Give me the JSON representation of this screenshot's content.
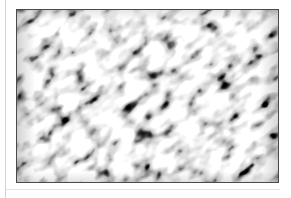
{
  "page": {
    "background_color": "#ffffff",
    "width": 291,
    "height": 198,
    "left_rule_color": "#d4d4d4",
    "bottom_rule_color": "#e3e3e3"
  },
  "figure": {
    "name": "grayscale-noise-texture",
    "border_color": "#4a4a4a",
    "base_color": "#9a9a9a",
    "x": 16,
    "y": 9,
    "width": 263,
    "height": 174,
    "texture": {
      "type": "fractal-turbulence",
      "orientation_degrees": 38,
      "base_frequency_x": 0.055,
      "base_frequency_y": 0.085,
      "octaves": 4,
      "seed": 17,
      "blur": 1.1,
      "contrast_slope": 2.45,
      "contrast_intercept": -0.72,
      "min_gray": "#1e1e1e",
      "max_gray": "#f2f2f2",
      "mean_gray": "#8c8c8c"
    }
  }
}
